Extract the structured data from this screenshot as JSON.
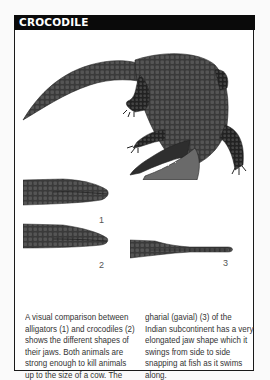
{
  "header": {
    "title": "CROCODILE",
    "background": "#0a0a0a",
    "text_color": "#ffffff"
  },
  "illustrations": {
    "main": "crocodile-full-body",
    "heads": [
      {
        "label": "1",
        "species": "alligator"
      },
      {
        "label": "2",
        "species": "crocodile"
      },
      {
        "label": "3",
        "species": "gharial"
      }
    ]
  },
  "caption": {
    "left_lines": [
      "A visual comparison between",
      "alligators (1) and crocodiles (2)",
      "shows the different shapes of",
      "their jaws. Both animals are",
      "strong enough to kill animals",
      "up to the size of a cow. The"
    ],
    "right_lines": [
      "gharial (gavial) (3) of the",
      "Indian subcontinent has a very",
      "elongated jaw shape which it",
      "swings from side to side",
      "snapping at fish as it swims",
      "along."
    ]
  }
}
